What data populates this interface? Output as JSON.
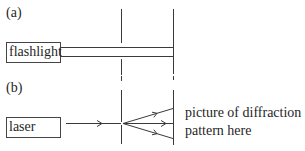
{
  "panels": [
    {
      "label": "(a)",
      "source": "flashlight"
    },
    {
      "label": "(b)",
      "source": "laser",
      "annotation_line1": "picture of diffraction",
      "annotation_line2": "pattern here"
    }
  ],
  "colors": {
    "line": "#3a3a3a",
    "text": "#1f1f1f",
    "background": "#ffffff"
  }
}
